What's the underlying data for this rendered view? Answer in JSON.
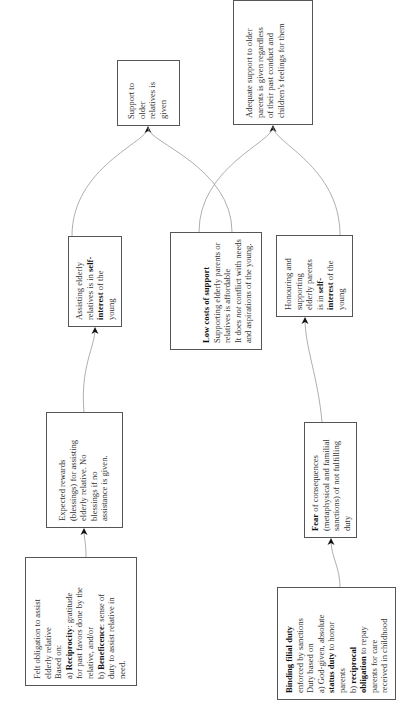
{
  "diagram": {
    "type": "flowchart",
    "orientation": "rotated-90-ccw",
    "nodes": {
      "felt_obligation": {
        "lines": [
          "Felt  obligation to assist",
          "elderly relative",
          "Based on:"
        ],
        "a_prefix": "a) ",
        "a_bold": "Reciprocity",
        "a_rest": ": gratitude",
        "a_lines": [
          "for past favors done by the",
          "relative, and/or"
        ],
        "b_prefix": "b) ",
        "b_bold": "Beneficence",
        "b_rest": ": sense of",
        "b_lines": [
          "duty to assist relative in",
          "need."
        ]
      },
      "expected_rewards": {
        "lines": [
          "Expected rewards",
          "(blessings) for assisting",
          "elderly relative.  No",
          "blessings if no",
          "assistance is given."
        ]
      },
      "assisting_self_interest": {
        "line1": "Assisting elderly",
        "line2_pre": "relatives is in ",
        "line2_bold": "self-",
        "line3_bold": "interest",
        "line3_rest": " of the",
        "line4": "young"
      },
      "support_given": {
        "lines": [
          "Support to",
          "older",
          "relatives is",
          "given"
        ]
      },
      "low_costs": {
        "title": "Low costs of support",
        "line1": "Supporting elderly parents or",
        "line2": "relatives is affordable",
        "line3_pre": "It does ",
        "line3_em": "not",
        "line3_rest": " conflict with needs",
        "line4": "and aspirations of the young."
      },
      "binding_duty": {
        "title": "Binding filial duty",
        "line1": "enforced by sanctions",
        "line2": "Duty based on",
        "line3": "a) God-given, absolute",
        "line4_bold": "status duty",
        "line4_rest": " to honor",
        "line5": "parents",
        "line6_pre": "b) ",
        "line6_bold": "reciprocal",
        "line7_bold": "obligation",
        "line7_rest": " to repay",
        "line8": "parents for care",
        "line9": "received in childhood"
      },
      "fear_consequences": {
        "title": "Fear",
        "title_rest": " of consequences",
        "lines": [
          "(metaphysical and familial",
          "sanctions) of not fulfilling",
          "duty"
        ]
      },
      "honouring_self_interest": {
        "line1": "Honouring and",
        "line2": "supporting",
        "line3": "elderly parents",
        "line4_pre": "is in ",
        "line4_bold": "self-",
        "line5_bold": "interest",
        "line5_rest": " of the",
        "line6": "young"
      },
      "adequate_support": {
        "lines": [
          "Adequate support to older",
          "parents is given regardless",
          "of their past conduct and",
          "children’s feelings for them"
        ]
      }
    },
    "edges": [
      {
        "from": "felt_obligation",
        "to": "expected_rewards"
      },
      {
        "from": "expected_rewards",
        "to": "assisting_self_interest"
      },
      {
        "from": "assisting_self_interest",
        "to": "support_given"
      },
      {
        "from": "low_costs",
        "to": "support_given"
      },
      {
        "from": "low_costs",
        "to": "adequate_support"
      },
      {
        "from": "binding_duty",
        "to": "fear_consequences"
      },
      {
        "from": "fear_consequences",
        "to": "honouring_self_interest"
      },
      {
        "from": "honouring_self_interest",
        "to": "adequate_support"
      }
    ],
    "colors": {
      "border": "#555555",
      "edge": "#999999",
      "arrowhead": "#111111",
      "text": "#333333"
    }
  }
}
